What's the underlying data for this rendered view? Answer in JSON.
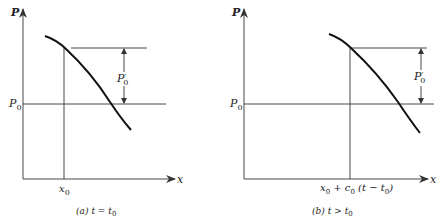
{
  "figure": {
    "panels": [
      {
        "id": "a",
        "y_axis_label": "P",
        "x_axis_label": "x",
        "baseline_label": "P",
        "baseline_sub": "0",
        "amplitude_label": "P",
        "amplitude_prime": "′",
        "amplitude_sub": "0",
        "position_label": "x",
        "position_sub": "0",
        "caption_prefix": "(a)",
        "caption_expr": "t = t",
        "caption_sub": "0"
      },
      {
        "id": "b",
        "y_axis_label": "P",
        "x_axis_label": "x",
        "baseline_label": "P",
        "baseline_sub": "0",
        "amplitude_label": "P",
        "amplitude_prime": "′",
        "amplitude_sub": "0",
        "position_parts": [
          "x",
          "0",
          " + c",
          "0",
          " (t − t",
          "0",
          ")"
        ],
        "caption_prefix": "(b)",
        "caption_expr": "t > t",
        "caption_sub": "0"
      }
    ],
    "colors": {
      "ink": "#222222",
      "background": "#ffffff"
    }
  }
}
